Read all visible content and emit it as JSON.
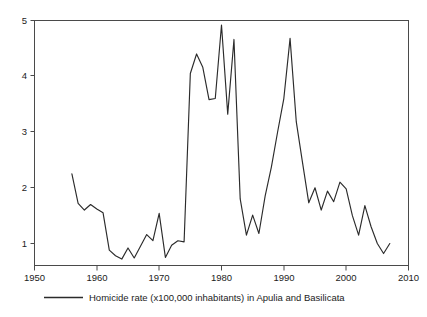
{
  "chart_data": {
    "type": "line",
    "title": "",
    "subtitle": "",
    "xlabel": "",
    "ylabel": "",
    "xlim": [
      1950,
      2010
    ],
    "ylim": [
      0.55,
      5.0
    ],
    "grid": false,
    "legend_position": "bottom",
    "x_ticks": [
      1950,
      1960,
      1970,
      1980,
      1990,
      2000,
      2010
    ],
    "x_tick_labels": [
      "1950",
      "1960",
      "1970",
      "1980",
      "1990",
      "2000",
      "2010"
    ],
    "y_ticks": [
      1,
      2,
      3,
      4,
      5
    ],
    "y_tick_labels": [
      "1",
      "2",
      "3",
      "4",
      "5"
    ],
    "series": [
      {
        "name": "Homicide rate (x100,000 inhabitants) in Apulia and Basilicata",
        "color": "#2b2b2b",
        "x": [
          1956,
          1957,
          1958,
          1959,
          1960,
          1961,
          1962,
          1963,
          1964,
          1965,
          1966,
          1967,
          1968,
          1969,
          1970,
          1971,
          1972,
          1973,
          1974,
          1975,
          1976,
          1977,
          1978,
          1979,
          1980,
          1981,
          1982,
          1983,
          1984,
          1985,
          1986,
          1987,
          1988,
          1989,
          1990,
          1991,
          1992,
          1993,
          1994,
          1995,
          1996,
          1997,
          1998,
          1999,
          2000,
          2001,
          2002,
          2003,
          2004,
          2005,
          2006,
          2007
        ],
        "values": [
          2.25,
          1.72,
          1.6,
          1.7,
          1.62,
          1.55,
          0.88,
          0.78,
          0.72,
          0.92,
          0.74,
          0.95,
          1.16,
          1.05,
          1.54,
          0.75,
          0.97,
          1.05,
          1.03,
          4.05,
          4.4,
          4.16,
          3.58,
          3.6,
          4.92,
          3.32,
          4.66,
          1.8,
          1.15,
          1.51,
          1.18,
          1.85,
          2.37,
          3.0,
          3.6,
          4.68,
          3.18,
          2.45,
          1.73,
          2.0,
          1.6,
          1.94,
          1.75,
          2.1,
          1.98,
          1.5,
          1.15,
          1.68,
          1.3,
          1.0,
          0.82,
          1.0
        ]
      }
    ]
  },
  "legend": {
    "entries": [
      {
        "label": "Homicide rate (x100,000 inhabitants) in Apulia and Basilicata",
        "color": "#2b2b2b",
        "marker": "line-swatch"
      }
    ]
  },
  "colors": {
    "background": "#ffffff",
    "series_line": "#2b2b2b",
    "axis_frame": "#4a4a4a",
    "text": "#1c1c1c"
  }
}
